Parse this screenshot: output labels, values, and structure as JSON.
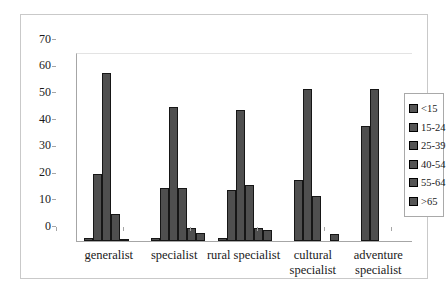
{
  "chart_data": {
    "type": "bar",
    "title": "",
    "categories": [
      "generalist",
      "specialist",
      "rural specialist",
      "cultural specialist",
      "adventure specialist"
    ],
    "category_label_lines": [
      [
        "generalist"
      ],
      [
        "specialist"
      ],
      [
        "rural specialist"
      ],
      [
        "cultural",
        "specialist"
      ],
      [
        "adventure",
        "specialist"
      ]
    ],
    "series": [
      {
        "name": "<15",
        "values": [
          1,
          1,
          1,
          0,
          0
        ]
      },
      {
        "name": "15-24",
        "values": [
          25,
          20,
          19,
          23,
          43
        ]
      },
      {
        "name": "25-39",
        "values": [
          63,
          50,
          49,
          57,
          57
        ]
      },
      {
        "name": "40-54",
        "values": [
          10,
          20,
          21,
          17,
          0
        ]
      },
      {
        "name": "55-64",
        "values": [
          0.5,
          5,
          5,
          0,
          0
        ]
      },
      {
        "name": ">65",
        "values": [
          0,
          3,
          4,
          2.5,
          0
        ]
      }
    ],
    "ylim": [
      0,
      70
    ],
    "yticks": [
      0,
      10,
      20,
      30,
      40,
      50,
      60,
      70
    ],
    "legend": {
      "position": "right",
      "labels": [
        "<15",
        "15-24",
        "25-39",
        "40-54",
        "55-64",
        ">65"
      ]
    },
    "grid": false,
    "colors": {
      "bar_fill": "#4f4f4f",
      "bar_border": "#161616",
      "axis": "#a6a6a6",
      "frame_border": "#c9c9c9",
      "background": "#ffffff",
      "text": "#1a1a1a"
    }
  }
}
